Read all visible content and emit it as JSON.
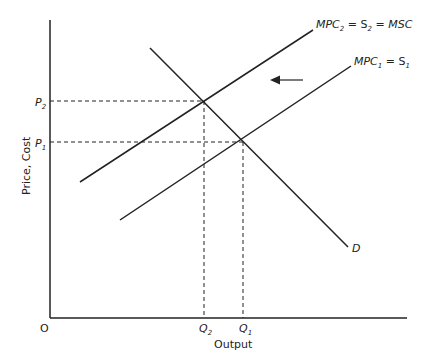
{
  "diagram": {
    "type": "supply-demand-externality",
    "axes": {
      "origin_label": "O",
      "x_label": "Output",
      "y_label": "Price, Cost"
    },
    "curves": [
      {
        "id": "mpc2",
        "label_main": "MPC",
        "label_sub": "2",
        "label_rest": " = S",
        "label_sub2": "2",
        "label_end": " = MSC"
      },
      {
        "id": "mpc1",
        "label_main": "MPC",
        "label_sub": "1",
        "label_rest": " = S",
        "label_sub2": "1"
      },
      {
        "id": "demand",
        "label": "D"
      }
    ],
    "price_levels": [
      {
        "label": "P",
        "sub": "2"
      },
      {
        "label": "P",
        "sub": "1"
      }
    ],
    "quantity_levels": [
      {
        "label": "Q",
        "sub": "2"
      },
      {
        "label": "Q",
        "sub": "1"
      }
    ],
    "shift_arrow": {
      "direction": "left"
    },
    "colors": {
      "line": "#222222",
      "background": "#ffffff"
    }
  }
}
